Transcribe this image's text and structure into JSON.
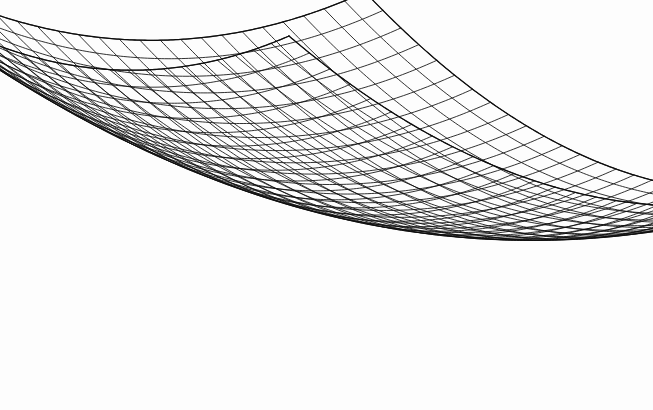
{
  "figure": {
    "title": "Wireframe mesh surface plot",
    "description": "Black-and-white wireframe net drawing of an upward-opening paraboloid bowl surface viewed in oblique 3D projection.",
    "background_color": "#fdfdfd",
    "line_color": "#0d0d0d",
    "line_width": 0.85,
    "width_px": 653,
    "height_px": 410
  },
  "chart_data": {
    "type": "mesh3d-wireframe",
    "surface_equation": "z = x^2 + y^2",
    "title": "",
    "subtitle": "",
    "xlabel": "",
    "ylabel": "",
    "zlabel": "",
    "grid": true,
    "legend": null,
    "axes_visible": false,
    "tick_labels": [],
    "annotations": [],
    "domain": {
      "u_min": -1.0,
      "u_max": 1.0,
      "v_min": -1.0,
      "v_max": 1.0,
      "u_divisions": 30,
      "v_divisions": 30
    },
    "zlim": [
      0.0,
      2.0
    ],
    "projection": {
      "kind": "oblique-isometric",
      "screen_corners": {
        "far_peak": [
          366,
          32
        ],
        "left_tip": [
          20,
          93
        ],
        "right_tip": [
          635,
          115
        ],
        "near_bottom": [
          310,
          394
        ]
      },
      "center": [
        327,
        214
      ],
      "u_axis_screen": [
        307,
        61
      ],
      "v_axis_screen": [
        269,
        83
      ],
      "z_axis_screen": [
        0,
        -200
      ]
    },
    "edge_curve_samples": {
      "back_left_edge": [
        [
          20,
          93
        ],
        [
          60,
          130
        ],
        [
          100,
          160
        ],
        [
          140,
          180
        ],
        [
          175,
          190
        ],
        [
          215,
          186
        ],
        [
          255,
          170
        ],
        [
          300,
          135
        ],
        [
          340,
          85
        ],
        [
          366,
          32
        ]
      ],
      "back_right_edge": [
        [
          366,
          32
        ],
        [
          398,
          88
        ],
        [
          432,
          135
        ],
        [
          466,
          170
        ],
        [
          500,
          192
        ],
        [
          530,
          200
        ],
        [
          560,
          190
        ],
        [
          590,
          165
        ],
        [
          615,
          140
        ],
        [
          635,
          115
        ]
      ],
      "front_left_edge": [
        [
          20,
          93
        ],
        [
          70,
          170
        ],
        [
          120,
          235
        ],
        [
          170,
          290
        ],
        [
          215,
          330
        ],
        [
          260,
          365
        ],
        [
          290,
          383
        ],
        [
          310,
          394
        ]
      ],
      "front_right_edge": [
        [
          310,
          394
        ],
        [
          350,
          392
        ],
        [
          400,
          378
        ],
        [
          450,
          352
        ],
        [
          495,
          318
        ],
        [
          540,
          275
        ],
        [
          580,
          228
        ],
        [
          612,
          175
        ],
        [
          635,
          115
        ]
      ]
    },
    "values_note": "Mesh height at each grid node equals u^2+v^2 over the unit square domain, giving zero at center and maximum 2.0 at the four corners."
  },
  "accessibility": {
    "alt_text": "Wireframe net plot of a paraboloid bowl, drawn with about thirty grid lines in each direction on a white background."
  }
}
